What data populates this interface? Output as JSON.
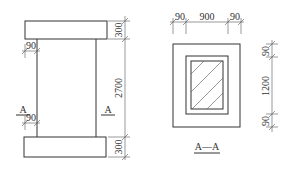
{
  "elevation": {
    "dims_vertical": [
      "300",
      "2700",
      "300"
    ],
    "dims_flange": [
      "90",
      "90"
    ],
    "section_marks": [
      "A",
      "A"
    ]
  },
  "section": {
    "title": "A—A",
    "dims_top": [
      "90",
      "900",
      "90"
    ],
    "dims_right": [
      "90",
      "1200",
      "90"
    ]
  },
  "colors": {
    "line": "#333333",
    "background": "#ffffff"
  }
}
